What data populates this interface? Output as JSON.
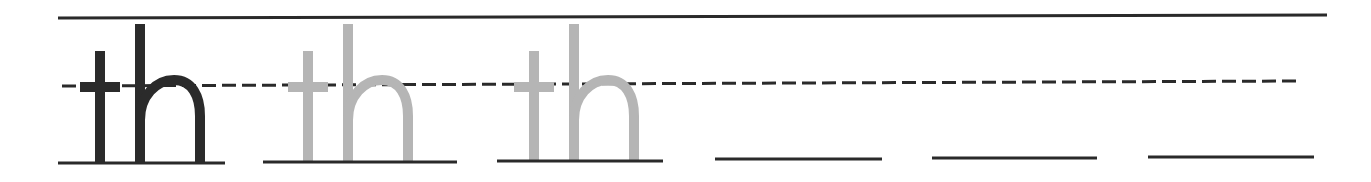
{
  "worksheet": {
    "title": "Handwriting practice: th",
    "practice_text": "th",
    "colors": {
      "background": "#ffffff",
      "rule": "#2a2a2a",
      "model_letter": "#2b2b2b",
      "trace_letter": "#b5b5b5"
    },
    "guides": {
      "top_line": {
        "x1": 58,
        "x2": 1327,
        "y1": 18,
        "y2": 15
      },
      "midline": {
        "x1": 62,
        "x2": 1297,
        "y1": 86,
        "y2": 81,
        "dashed": true
      }
    },
    "cells": [
      {
        "kind": "model",
        "text": "th",
        "x": 80,
        "baseline": {
          "x1": 58,
          "x2": 225,
          "y": 163
        }
      },
      {
        "kind": "trace",
        "text": "th",
        "x": 288,
        "baseline": {
          "x1": 263,
          "x2": 457,
          "y": 162
        }
      },
      {
        "kind": "trace",
        "text": "th",
        "x": 514,
        "baseline": {
          "x1": 497,
          "x2": 663,
          "y": 161
        }
      },
      {
        "kind": "blank",
        "text": "",
        "baseline": {
          "x1": 715,
          "x2": 882,
          "y": 159
        }
      },
      {
        "kind": "blank",
        "text": "",
        "baseline": {
          "x1": 932,
          "x2": 1097,
          "y": 158
        }
      },
      {
        "kind": "blank",
        "text": "",
        "baseline": {
          "x1": 1148,
          "x2": 1314,
          "y": 157
        }
      }
    ]
  }
}
